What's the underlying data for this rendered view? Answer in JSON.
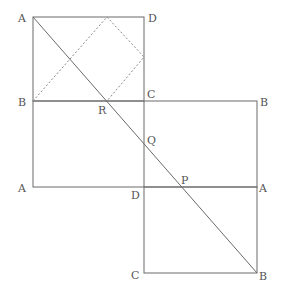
{
  "diagram": {
    "type": "geometry-squares-with-diagonal",
    "colors": {
      "line": "#6a6a6a",
      "dashed": "#8a8a8a",
      "label": "#555555",
      "background": "#ffffff"
    },
    "labels": [
      {
        "id": "A-top",
        "text": "A",
        "x": 18,
        "y": 22
      },
      {
        "id": "D-top",
        "text": "D",
        "x": 148,
        "y": 22
      },
      {
        "id": "B-left",
        "text": "B",
        "x": 18,
        "y": 106
      },
      {
        "id": "R",
        "text": "R",
        "x": 98,
        "y": 114
      },
      {
        "id": "C-mid",
        "text": "C",
        "x": 147,
        "y": 98
      },
      {
        "id": "B-right",
        "text": "B",
        "x": 260,
        "y": 106
      },
      {
        "id": "Q",
        "text": "Q",
        "x": 147,
        "y": 144
      },
      {
        "id": "P",
        "text": "P",
        "x": 181,
        "y": 184
      },
      {
        "id": "A-left",
        "text": "A",
        "x": 18,
        "y": 192
      },
      {
        "id": "D-mid",
        "text": "D",
        "x": 131,
        "y": 199
      },
      {
        "id": "A-right",
        "text": "A",
        "x": 259,
        "y": 192
      },
      {
        "id": "C-bottom",
        "text": "C",
        "x": 131,
        "y": 279
      },
      {
        "id": "B-bottom",
        "text": "B",
        "x": 259,
        "y": 280
      }
    ]
  }
}
